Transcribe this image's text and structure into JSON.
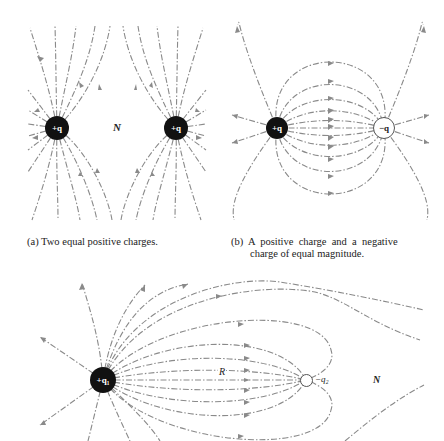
{
  "figure": {
    "panel_a": {
      "caption": "(a)  Two equal positive charges.",
      "charges": [
        {
          "label": "+q",
          "sign": "positive",
          "x": 57,
          "y": 128
        },
        {
          "label": "+q",
          "sign": "positive",
          "x": 176,
          "y": 128
        }
      ],
      "neutral_point_label": "N"
    },
    "panel_b": {
      "caption_line1": "(b)  A  positive  charge  and  a  negative",
      "caption_line2": "charge of equal magnitude.",
      "charges": [
        {
          "label": "+q",
          "sign": "positive",
          "x": 277,
          "y": 128
        },
        {
          "label": "−q",
          "sign": "negative",
          "x": 384,
          "y": 128
        }
      ]
    },
    "panel_c": {
      "charges": [
        {
          "label": "+q₁",
          "sign": "positive",
          "x": 103,
          "y": 380
        },
        {
          "label": "−q₂",
          "sign": "negative",
          "x": 306,
          "y": 380
        }
      ],
      "separation_label": "R",
      "neutral_point_label": "N"
    },
    "colors": {
      "field_line": "#8a8a8a",
      "positive_charge": "#111111",
      "negative_charge": "#ffffff",
      "text": "#222222"
    }
  }
}
